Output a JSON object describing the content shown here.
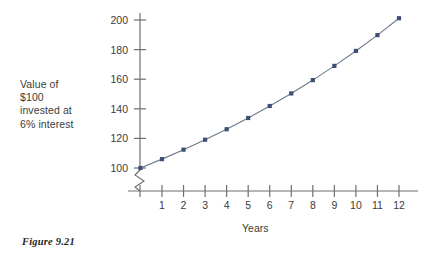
{
  "figure": {
    "caption": "Figure 9.21"
  },
  "chart_data": {
    "type": "line",
    "title": "",
    "xlabel": "Years",
    "ylabel": "Value of $100 invested at 6% interest",
    "ylabel_lines": [
      "Value of",
      "$100",
      "invested at",
      "6% interest"
    ],
    "x": [
      0,
      1,
      2,
      3,
      4,
      5,
      6,
      7,
      8,
      9,
      10,
      11,
      12
    ],
    "values": [
      100,
      106,
      112.4,
      119.1,
      126.2,
      133.8,
      141.9,
      150.4,
      159.4,
      169.0,
      179.1,
      189.8,
      201.2
    ],
    "xtick_labels": [
      "1",
      "2",
      "3",
      "4",
      "5",
      "6",
      "7",
      "8",
      "9",
      "10",
      "11",
      "12"
    ],
    "xticks": [
      1,
      2,
      3,
      4,
      5,
      6,
      7,
      8,
      9,
      10,
      11,
      12
    ],
    "ytick_labels": [
      "100",
      "120",
      "140",
      "160",
      "180",
      "200"
    ],
    "yticks": [
      100,
      120,
      140,
      160,
      180,
      200
    ],
    "xlim": [
      0,
      12.9
    ],
    "ylim": [
      100,
      205
    ],
    "grid": false,
    "legend": false,
    "axis_break": true,
    "marker": "square",
    "marker_color": "#3d4f74",
    "line_color": "#6b7a8f",
    "axis_color": "#6e6e6e"
  }
}
